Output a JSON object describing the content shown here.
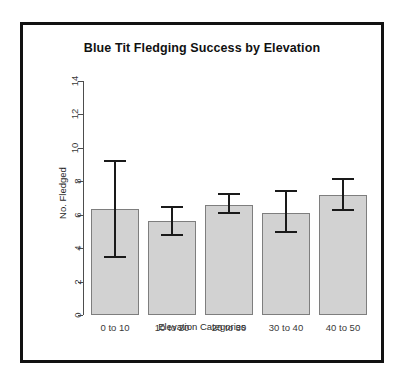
{
  "chart_data": {
    "type": "bar",
    "title": "Blue Tit Fledging Success by Elevation",
    "xlabel": "Elevation Categories",
    "ylabel": "No. Fledged",
    "categories": [
      "0 to 10",
      "10 to 20",
      "20 to 30",
      "30 to 40",
      "40 to 50"
    ],
    "values": [
      6.35,
      5.6,
      6.6,
      6.1,
      7.2
    ],
    "error_lower": [
      3.4,
      4.7,
      6.05,
      4.9,
      6.25
    ],
    "error_upper": [
      9.25,
      6.55,
      7.3,
      7.45,
      8.2
    ],
    "ylim": [
      0,
      14
    ],
    "yticks": [
      0,
      2,
      4,
      6,
      8,
      10,
      12,
      14
    ],
    "ytick_labels": [
      "0",
      "2",
      "4",
      "6",
      "8",
      "10",
      "12",
      "14"
    ],
    "grid": false,
    "legend": false,
    "bar_color": "#d2d2d2",
    "bar_border_color": "#7e7e7e",
    "error_color": "#1a1a1a",
    "axis_color": "#4d4d4d",
    "frame_color": "#111111",
    "background": "#ffffff"
  }
}
